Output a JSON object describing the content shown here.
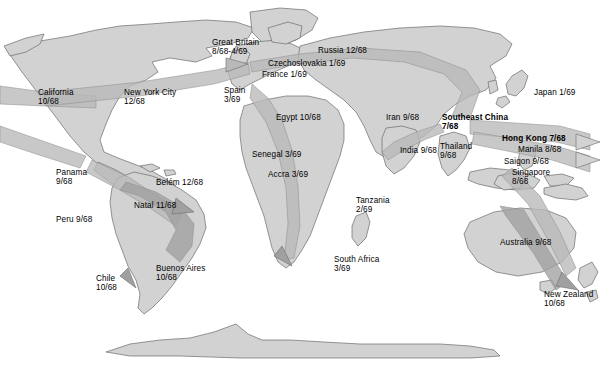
{
  "map": {
    "title": "Spread of Hong Kong influenza pandemic 1968-1969",
    "colors": {
      "background": "#ffffff",
      "land_light": "#d2d2d2",
      "land_mid": "#b4b4b4",
      "flow_band": "#b9b9b9",
      "flow_band_dark": "#a0a0a0",
      "outline": "#6b6b6b",
      "text": "#000000"
    }
  },
  "labels": [
    {
      "name": "california",
      "text": "California\n10/68",
      "x": 38,
      "y": 88,
      "bold": false,
      "align": "left"
    },
    {
      "name": "new-york-city",
      "text": "New York City\n12/68",
      "x": 124,
      "y": 88,
      "bold": false,
      "align": "left"
    },
    {
      "name": "great-britain",
      "text": "Great Britain\n8/68-4/69",
      "x": 212,
      "y": 38,
      "bold": false,
      "align": "left"
    },
    {
      "name": "czechoslovakia",
      "text": "Czechoslovakia 1/69",
      "x": 268,
      "y": 59,
      "bold": false,
      "align": "left"
    },
    {
      "name": "france",
      "text": "France 1/69",
      "x": 262,
      "y": 70,
      "bold": false,
      "align": "left"
    },
    {
      "name": "russia",
      "text": "Russia 12/68",
      "x": 318,
      "y": 46,
      "bold": false,
      "align": "left"
    },
    {
      "name": "spain",
      "text": "Spain\n3/69",
      "x": 224,
      "y": 86,
      "bold": false,
      "align": "left"
    },
    {
      "name": "japan",
      "text": "Japan 1/69",
      "x": 534,
      "y": 88,
      "bold": false,
      "align": "left"
    },
    {
      "name": "egypt",
      "text": "Egypt 10/68",
      "x": 276,
      "y": 113,
      "bold": false,
      "align": "left"
    },
    {
      "name": "iran",
      "text": "Iran 9/68",
      "x": 386,
      "y": 113,
      "bold": false,
      "align": "left"
    },
    {
      "name": "southeast-china",
      "text": "Southeast China\n7/68",
      "x": 442,
      "y": 113,
      "bold": true,
      "align": "left"
    },
    {
      "name": "hong-kong",
      "text": "Hong Kong 7/68",
      "x": 502,
      "y": 134,
      "bold": true,
      "align": "left"
    },
    {
      "name": "india",
      "text": "India 9/68",
      "x": 400,
      "y": 146,
      "bold": false,
      "align": "left"
    },
    {
      "name": "thailand",
      "text": "Thailand\n9/68",
      "x": 440,
      "y": 142,
      "bold": false,
      "align": "left"
    },
    {
      "name": "manila",
      "text": "Manila 8/68",
      "x": 518,
      "y": 145,
      "bold": false,
      "align": "left"
    },
    {
      "name": "saigon",
      "text": "Saigon 9/68",
      "x": 504,
      "y": 157,
      "bold": false,
      "align": "left"
    },
    {
      "name": "singapore",
      "text": "Singapore\n8/68",
      "x": 512,
      "y": 168,
      "bold": false,
      "align": "left"
    },
    {
      "name": "senegal",
      "text": "Senegal 3/69",
      "x": 252,
      "y": 150,
      "bold": false,
      "align": "left"
    },
    {
      "name": "accra",
      "text": "Accra 3/69",
      "x": 268,
      "y": 170,
      "bold": false,
      "align": "left"
    },
    {
      "name": "panama",
      "text": "Panama\n9/68",
      "x": 56,
      "y": 168,
      "bold": false,
      "align": "left"
    },
    {
      "name": "belem",
      "text": "Belém 12/68",
      "x": 156,
      "y": 178,
      "bold": false,
      "align": "left"
    },
    {
      "name": "natal",
      "text": "Natal 11/68",
      "x": 134,
      "y": 201,
      "bold": false,
      "align": "left"
    },
    {
      "name": "peru",
      "text": "Peru 9/68",
      "x": 56,
      "y": 215,
      "bold": false,
      "align": "left"
    },
    {
      "name": "tanzania",
      "text": "Tanzania\n2/69",
      "x": 356,
      "y": 196,
      "bold": false,
      "align": "left"
    },
    {
      "name": "south-africa",
      "text": "South Africa\n3/69",
      "x": 334,
      "y": 255,
      "bold": false,
      "align": "left"
    },
    {
      "name": "australia",
      "text": "Australia 9/68",
      "x": 500,
      "y": 238,
      "bold": false,
      "align": "left"
    },
    {
      "name": "new-zealand",
      "text": "New Zealand\n10/68",
      "x": 544,
      "y": 290,
      "bold": false,
      "align": "left"
    },
    {
      "name": "chile",
      "text": "Chile\n10/68",
      "x": 96,
      "y": 274,
      "bold": false,
      "align": "left"
    },
    {
      "name": "buenos-aires",
      "text": "Buenos Aires\n10/68",
      "x": 156,
      "y": 264,
      "bold": false,
      "align": "left"
    }
  ]
}
